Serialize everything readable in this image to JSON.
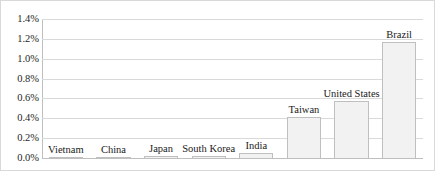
{
  "chart_data": {
    "type": "bar",
    "title": "",
    "xlabel": "",
    "ylabel": "",
    "ylim": [
      0.0,
      1.4
    ],
    "ytick_labels": [
      "1.4%",
      "1.2%",
      "1.0%",
      "0.8%",
      "0.6%",
      "0.4%",
      "0.2%",
      "0.0%"
    ],
    "ytick_values": [
      1.4,
      1.2,
      1.0,
      0.8,
      0.6,
      0.4,
      0.2,
      0.0
    ],
    "grid": true,
    "legend": "none",
    "categories": [
      "Vietnam",
      "China",
      "Japan",
      "South Korea",
      "India",
      "Taiwan",
      "United States",
      "Brazil"
    ],
    "values": [
      0.01,
      0.01,
      0.02,
      0.02,
      0.05,
      0.41,
      0.57,
      1.17
    ],
    "bar_fill_color": "#f2f2f2",
    "bar_border_color": "#bfbfbf",
    "gridline_color": "#d9d9d9",
    "label_color": "#1a1a1a"
  }
}
